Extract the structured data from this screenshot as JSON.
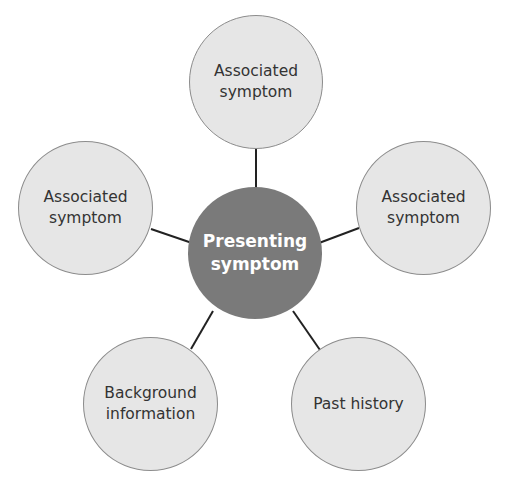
{
  "colors": {
    "outer_fill": "#e6e6e6",
    "outer_stroke": "#8c8c8c",
    "center_fill": "#7a7a7a",
    "connector": "#222222"
  },
  "center": {
    "label": "Presenting\nsymptom"
  },
  "nodes": [
    {
      "id": "top",
      "label": "Associated\nsymptom"
    },
    {
      "id": "left",
      "label": "Associated\nsymptom"
    },
    {
      "id": "right",
      "label": "Associated\nsymptom"
    },
    {
      "id": "bottom-left",
      "label": "Background\ninformation"
    },
    {
      "id": "bottom-right",
      "label": "Past history"
    }
  ]
}
